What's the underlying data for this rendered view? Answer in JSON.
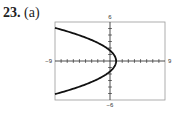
{
  "problem": {
    "number": "23.",
    "part": "(a)"
  },
  "chart_data": {
    "type": "line",
    "title": "",
    "xlabel": "",
    "ylabel": "",
    "xlim": [
      -9,
      9
    ],
    "ylim": [
      -6,
      6
    ],
    "tick_labels": {
      "xmin": "−9",
      "xmax": "9",
      "ymin": "−6",
      "ymax": "6"
    },
    "grid": false,
    "series": [
      {
        "name": "curve",
        "description": "leftward-opening parabola, vertex near (1, 0)",
        "x": [
          -9,
          -5,
          -2,
          0,
          1,
          0,
          -2,
          -5,
          -9
        ],
        "y": [
          5.1,
          4.0,
          3.1,
          2.0,
          0,
          -2.0,
          -3.1,
          -4.0,
          -5.1
        ]
      }
    ]
  }
}
